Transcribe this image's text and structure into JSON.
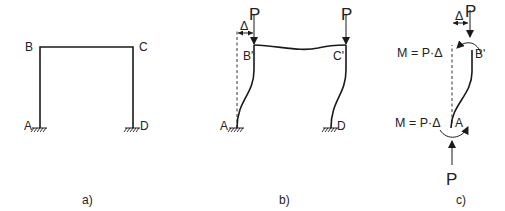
{
  "panels": [
    {
      "caption": "a)",
      "title": "Undeformed portal frame",
      "nodes": {
        "A": "A",
        "B": "B",
        "C": "C",
        "D": "D"
      }
    },
    {
      "caption": "b)",
      "title": "Sway-deformed frame under vertical loads",
      "nodes": {
        "A": "A",
        "B": "B'",
        "C": "C'",
        "D": "D"
      },
      "loads": [
        "P",
        "P"
      ],
      "displacement": "Δ"
    },
    {
      "caption": "c)",
      "title": "Free body of column A–B'",
      "nodes": {
        "A": "A",
        "B": "B'"
      },
      "loads": [
        "P",
        "P"
      ],
      "displacement": "Δ",
      "moment_top": "M = P·Δ",
      "moment_bottom": "M = P·Δ"
    }
  ],
  "colors": {
    "line": "#1a1a1a",
    "text": "#222222",
    "background": "#ffffff"
  }
}
